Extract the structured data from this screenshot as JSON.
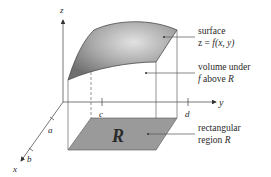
{
  "diagram": {
    "axes": {
      "x_label": "x",
      "y_label": "y",
      "z_label": "z"
    },
    "ticks": {
      "x_axis": [
        "a",
        "b"
      ],
      "y_axis": [
        "c",
        "d"
      ]
    },
    "annotations": {
      "surface_line1": "surface",
      "surface_line2_prefix": "z = ",
      "surface_line2_func": "f",
      "surface_line2_args": "(x, y)",
      "volume_line1": "volume under",
      "volume_line2_f": "f",
      "volume_line2_mid": " above ",
      "volume_line2_R": "R",
      "region_line1": "rectangular",
      "region_line2_prefix": "region ",
      "region_line2_R": "R"
    },
    "region_symbol": "R",
    "colors": {
      "surface_fill": "#8c8c8c",
      "surface_highlight": "#d9d9d9",
      "region_fill": "#9a9a9a",
      "line": "#555555",
      "text": "#2a2a2a"
    }
  }
}
